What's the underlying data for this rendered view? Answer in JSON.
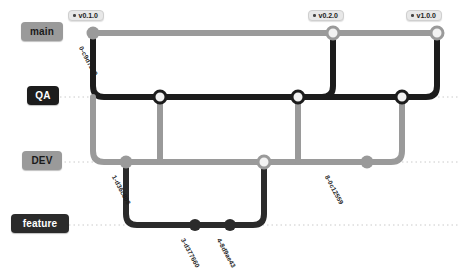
{
  "diagram": {
    "colors": {
      "main": "#9a9a9a",
      "qa": "#1c1c1c",
      "dev": "#9a9a9a",
      "feature": "#2b2b2b",
      "node_fill_hollow": "#f2f2f2",
      "background": "#ffffff",
      "lane_guide": "#bdbdbd"
    }
  },
  "branches": [
    {
      "id": "main",
      "label": "main",
      "lane_y": 33,
      "color": "#9a9a9a",
      "pill_style": "light"
    },
    {
      "id": "qa",
      "label": "QA",
      "lane_y": 97,
      "color": "#1c1c1c",
      "pill_style": "dark"
    },
    {
      "id": "dev",
      "label": "DEV",
      "lane_y": 162,
      "color": "#9a9a9a",
      "pill_style": "light"
    },
    {
      "id": "feature",
      "label": "feature",
      "lane_y": 225,
      "color": "#2b2b2b",
      "pill_style": "dark"
    }
  ],
  "tags": [
    {
      "id": "tag-v010",
      "label": "v0.1.0",
      "x": 68,
      "y": 10
    },
    {
      "id": "tag-v020",
      "label": "v0.2.0",
      "x": 308,
      "y": 10
    },
    {
      "id": "tag-v100",
      "label": "v1.0.0",
      "x": 406,
      "y": 10
    }
  ],
  "nodes": [
    {
      "id": "n-main-0",
      "branch": "main",
      "x": 93,
      "y": 33,
      "style": "filled",
      "color": "#9a9a9a",
      "r": 6.5
    },
    {
      "id": "n-main-1",
      "branch": "main",
      "x": 333,
      "y": 33,
      "style": "hollow",
      "color": "#9a9a9a",
      "r": 6.0
    },
    {
      "id": "n-main-2",
      "branch": "main",
      "x": 437,
      "y": 33,
      "style": "hollow",
      "color": "#9a9a9a",
      "r": 6.0
    },
    {
      "id": "n-qa-0",
      "branch": "qa",
      "x": 160,
      "y": 97,
      "style": "hollow",
      "color": "#1c1c1c",
      "r": 6.0
    },
    {
      "id": "n-qa-1",
      "branch": "qa",
      "x": 298,
      "y": 97,
      "style": "hollow",
      "color": "#1c1c1c",
      "r": 6.0
    },
    {
      "id": "n-qa-2",
      "branch": "qa",
      "x": 402,
      "y": 97,
      "style": "hollow",
      "color": "#1c1c1c",
      "r": 6.0
    },
    {
      "id": "n-dev-0",
      "branch": "dev",
      "x": 126,
      "y": 162,
      "style": "filled",
      "color": "#9a9a9a",
      "r": 6.5
    },
    {
      "id": "n-dev-1",
      "branch": "dev",
      "x": 264,
      "y": 162,
      "style": "hollow",
      "color": "#9a9a9a",
      "r": 6.0
    },
    {
      "id": "n-dev-2",
      "branch": "dev",
      "x": 367,
      "y": 162,
      "style": "filled",
      "color": "#9a9a9a",
      "r": 6.5
    },
    {
      "id": "n-feat-0",
      "branch": "feature",
      "x": 195,
      "y": 225,
      "style": "filled",
      "color": "#2b2b2b",
      "r": 6.0
    },
    {
      "id": "n-feat-1",
      "branch": "feature",
      "x": 230,
      "y": 225,
      "style": "filled",
      "color": "#2b2b2b",
      "r": 6.0
    }
  ],
  "commit_labels": [
    {
      "id": "c0",
      "text": "0-c9d7239",
      "x": 84,
      "y": 45,
      "rotate": 62
    },
    {
      "id": "c1",
      "text": "1-d36c808",
      "x": 117,
      "y": 174,
      "rotate": 62
    },
    {
      "id": "c3",
      "text": "3-d377660",
      "x": 186,
      "y": 237,
      "rotate": 62
    },
    {
      "id": "c4",
      "text": "4-8d9ae43",
      "x": 222,
      "y": 237,
      "rotate": 62
    },
    {
      "id": "c8",
      "text": "8-0c12559",
      "x": 330,
      "y": 174,
      "rotate": 62
    }
  ],
  "edges": [
    {
      "id": "e-main-trunk",
      "color": "#9a9a9a",
      "width": 6,
      "d": "M 93 33 L 437 33"
    },
    {
      "id": "e-main-to-qa",
      "color": "#1c1c1c",
      "width": 6,
      "d": "M 93 33 L 93 86 Q 93 97 104 97 L 402 97"
    },
    {
      "id": "e-qa-to-dev-a",
      "color": "#9a9a9a",
      "width": 6,
      "d": "M 93 97 L 93 151 Q 93 162 104 162 L 367 162"
    },
    {
      "id": "e-qa-node-down",
      "color": "#9a9a9a",
      "width": 6,
      "d": "M 160 97 L 160 162"
    },
    {
      "id": "e-dev-to-feat",
      "color": "#2b2b2b",
      "width": 6,
      "d": "M 126 162 L 126 214 Q 126 225 137 225 L 253 225 Q 264 225 264 214 L 264 162"
    },
    {
      "id": "e-dev1-up-qa",
      "color": "#9a9a9a",
      "width": 6,
      "d": "M 298 97 L 298 162"
    },
    {
      "id": "e-qa1-up-main",
      "color": "#1c1c1c",
      "width": 6,
      "d": "M 333 33 L 333 86 Q 333 97 322 97 L 298 97"
    },
    {
      "id": "e-dev2-up-qa2",
      "color": "#9a9a9a",
      "width": 6,
      "d": "M 402 97 L 402 151 Q 402 162 391 162 L 367 162"
    },
    {
      "id": "e-qa2-up-main2",
      "color": "#1c1c1c",
      "width": 6,
      "d": "M 437 33 L 437 86 Q 437 97 426 97 L 402 97"
    }
  ],
  "lane_guides": [
    {
      "id": "guide-qa",
      "y": 97,
      "x1": 60,
      "x2": 458
    },
    {
      "id": "guide-dev",
      "y": 162,
      "x1": 60,
      "x2": 458
    },
    {
      "id": "guide-feature",
      "y": 225,
      "x1": 60,
      "x2": 458
    }
  ]
}
